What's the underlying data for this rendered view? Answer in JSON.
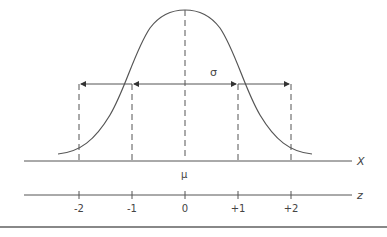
{
  "diagram": {
    "type": "normal-distribution",
    "curve_label": "Normal distribution curve",
    "sigma_label": "σ",
    "mean_label": "μ",
    "x_axis_label": "X",
    "z_axis_label": "z",
    "z_ticks": [
      "-2",
      "-1",
      "0",
      "+1",
      "+2"
    ],
    "colors": {
      "line": "#555555",
      "rule": "#888888"
    }
  }
}
